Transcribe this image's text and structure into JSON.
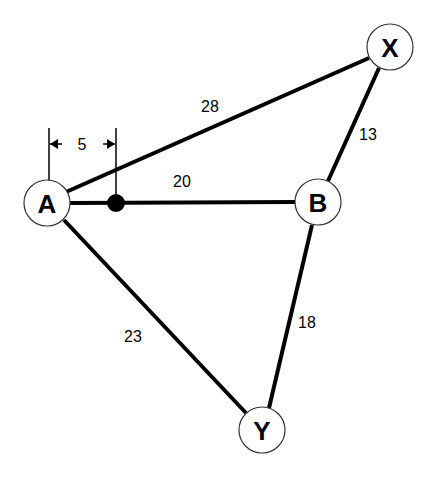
{
  "diagram": {
    "type": "weighted-graph",
    "nodes": [
      {
        "id": "A",
        "label": "A",
        "x": 47,
        "y": 203
      },
      {
        "id": "B",
        "label": "B",
        "x": 318,
        "y": 202
      },
      {
        "id": "X",
        "label": "X",
        "x": 390,
        "y": 47
      },
      {
        "id": "Y",
        "label": "Y",
        "x": 262,
        "y": 430
      }
    ],
    "edges": [
      {
        "from": "A",
        "to": "X",
        "weight": "28"
      },
      {
        "from": "A",
        "to": "B",
        "weight": "20"
      },
      {
        "from": "X",
        "to": "B",
        "weight": "13"
      },
      {
        "from": "A",
        "to": "Y",
        "weight": "23"
      },
      {
        "from": "B",
        "to": "Y",
        "weight": "18"
      }
    ],
    "marker": {
      "label": "point on A-B",
      "distance_from_A": "5"
    },
    "colors": {
      "line": "#000000",
      "node_fill": "#ffffff",
      "node_stroke": "#333333"
    }
  }
}
